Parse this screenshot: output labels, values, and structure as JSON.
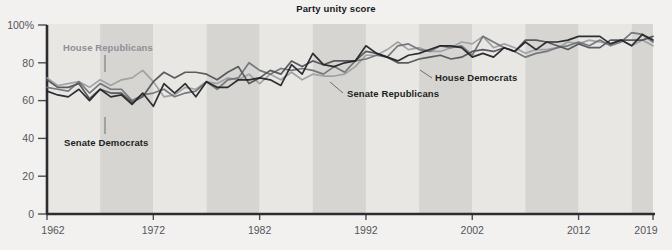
{
  "chart_data": {
    "type": "line",
    "title": "Party unity score",
    "xlabel": "",
    "ylabel": "",
    "xlim": [
      1962,
      2019
    ],
    "ylim": [
      0,
      100
    ],
    "grid": false,
    "legend_position": "inline-annotations",
    "x_ticks": [
      "1962",
      "1972",
      "1982",
      "1992",
      "2002",
      "2012",
      "2019"
    ],
    "x_tick_values": [
      1962,
      1972,
      1982,
      1992,
      2002,
      2012,
      2019
    ],
    "y_ticks": [
      "0",
      "20",
      "40",
      "60",
      "80",
      "100%"
    ],
    "y_tick_values": [
      0,
      20,
      40,
      60,
      80,
      100
    ],
    "background_bands": {
      "note": "alternating 5-year shaded vertical bands",
      "light": "#e8e7e4",
      "dark": "#d6d5d1"
    },
    "x": [
      1962,
      1963,
      1964,
      1965,
      1966,
      1967,
      1968,
      1969,
      1970,
      1971,
      1972,
      1973,
      1974,
      1975,
      1976,
      1977,
      1978,
      1979,
      1980,
      1981,
      1982,
      1983,
      1984,
      1985,
      1986,
      1987,
      1988,
      1989,
      1990,
      1991,
      1992,
      1993,
      1994,
      1995,
      1996,
      1997,
      1998,
      1999,
      2000,
      2001,
      2002,
      2003,
      2004,
      2005,
      2006,
      2007,
      2008,
      2009,
      2010,
      2011,
      2012,
      2013,
      2014,
      2015,
      2016,
      2017,
      2018,
      2019
    ],
    "series": [
      {
        "name": "House Republicans",
        "color": "#9b9da1",
        "values": [
          72,
          68,
          69,
          70,
          67,
          71,
          68,
          71,
          72,
          76,
          70,
          62,
          63,
          67,
          66,
          70,
          69,
          72,
          71,
          74,
          69,
          74,
          71,
          75,
          71,
          74,
          73,
          73,
          74,
          78,
          84,
          84,
          87,
          91,
          87,
          88,
          86,
          86,
          88,
          91,
          90,
          94,
          88,
          90,
          88,
          85,
          87,
          87,
          88,
          91,
          90,
          92,
          91,
          90,
          92,
          89,
          92,
          89
        ]
      },
      {
        "name": "House Democrats",
        "color": "#4e5055",
        "values": [
          71,
          67,
          67,
          69,
          61,
          66,
          64,
          64,
          59,
          62,
          70,
          75,
          72,
          75,
          75,
          74,
          71,
          75,
          78,
          69,
          72,
          76,
          74,
          81,
          78,
          81,
          79,
          81,
          81,
          81,
          86,
          85,
          83,
          80,
          80,
          82,
          83,
          84,
          82,
          83,
          86,
          87,
          86,
          88,
          86,
          92,
          92,
          91,
          89,
          87,
          90,
          88,
          88,
          92,
          92,
          92,
          92,
          94
        ]
      },
      {
        "name": "Senate Republicans",
        "color": "#6e7075"
      },
      {
        "name": "Senate Democrats",
        "color": "#1d1f23",
        "values": [
          65,
          63,
          62,
          66,
          60,
          66,
          62,
          63,
          58,
          64,
          57,
          69,
          64,
          69,
          62,
          70,
          67,
          67,
          71,
          71,
          72,
          71,
          68,
          79,
          74,
          85,
          79,
          78,
          80,
          81,
          89,
          85,
          83,
          81,
          84,
          85,
          87,
          89,
          89,
          88,
          83,
          85,
          83,
          88,
          86,
          91,
          87,
          91,
          91,
          92,
          94,
          94,
          94,
          90,
          92,
          89,
          95,
          92
        ]
      },
      {
        "name": "Senate Republicans (values)",
        "color": "#6e7075",
        "values": [
          67,
          66,
          65,
          70,
          64,
          69,
          66,
          66,
          60,
          63,
          64,
          66,
          62,
          64,
          65,
          70,
          66,
          71,
          72,
          80,
          76,
          74,
          77,
          76,
          77,
          76,
          74,
          78,
          75,
          81,
          82,
          84,
          83,
          89,
          90,
          87,
          86,
          89,
          88,
          89,
          84,
          94,
          91,
          88,
          86,
          83,
          85,
          86,
          88,
          89,
          91,
          89,
          92,
          89,
          91,
          96,
          95,
          91
        ]
      }
    ]
  }
}
